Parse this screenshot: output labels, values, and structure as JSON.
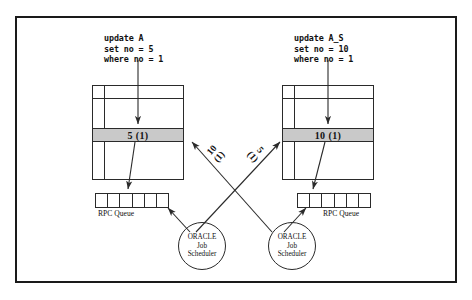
{
  "diagram": {
    "frame": {
      "name": "outer-border"
    },
    "sites": [
      {
        "id": "left",
        "sql": "update A\nset no = 5\nwhere no = 1",
        "table_value": "5  (1)",
        "queue_label": "RPC Queue",
        "queue_cells": 6,
        "scheduler": {
          "line1": "ORACLE",
          "line2": "Job",
          "line3": "Scheduler"
        }
      },
      {
        "id": "right",
        "sql": "update A_S\nset no = 10\nwhere no = 1",
        "table_value": "10  (1)",
        "queue_label": "RPC Queue",
        "queue_cells": 6,
        "scheduler": {
          "line1": "ORACLE",
          "line2": "Job",
          "line3": "Scheduler"
        }
      }
    ],
    "transfers": [
      {
        "id": "to-left",
        "value": "10",
        "txn": "(1)",
        "from": "right-scheduler",
        "to": "left-table"
      },
      {
        "id": "to-right",
        "value": "5",
        "txn": "(1)",
        "from": "left-scheduler",
        "to": "right-table"
      }
    ],
    "colors": {
      "stroke": "#2a2a2a",
      "highlight_row": "#c9c9c9",
      "text": "#111111",
      "background": "#ffffff"
    }
  }
}
